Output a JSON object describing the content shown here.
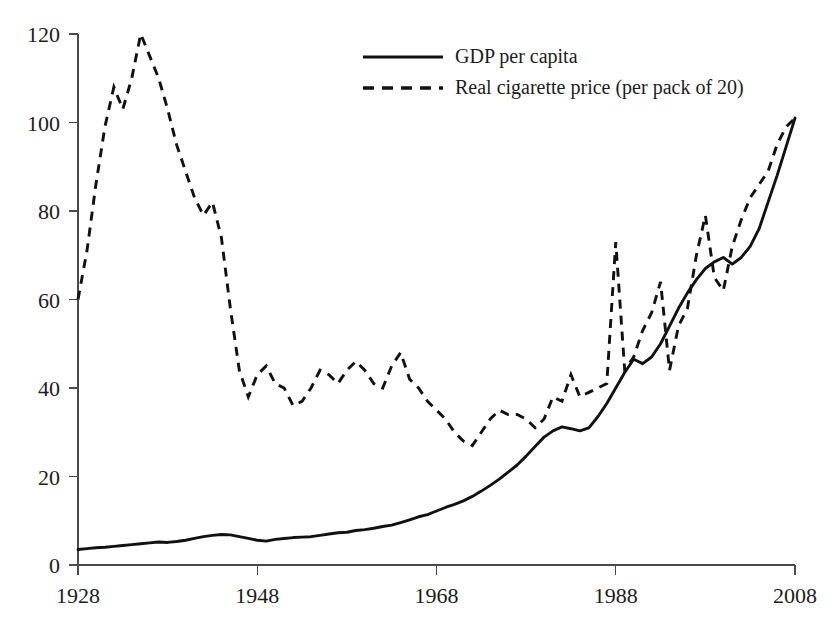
{
  "chart_data": {
    "type": "line",
    "title": "",
    "subtitle": "",
    "xlabel": "",
    "ylabel": "",
    "xlim": [
      1928,
      2008
    ],
    "ylim": [
      0,
      120
    ],
    "xticks": [
      1928,
      1948,
      1968,
      1988,
      2008
    ],
    "xtick_labels": [
      "1928",
      "1948",
      "1968",
      "1988",
      "2008"
    ],
    "yticks": [
      0,
      20,
      40,
      60,
      80,
      100,
      120
    ],
    "ytick_labels": [
      "0",
      "20",
      "40",
      "60",
      "80",
      "100",
      "120"
    ],
    "grid": false,
    "legend_position": "top-center-right",
    "x": [
      1928,
      1929,
      1930,
      1931,
      1932,
      1933,
      1934,
      1935,
      1936,
      1937,
      1938,
      1939,
      1940,
      1941,
      1942,
      1943,
      1944,
      1945,
      1946,
      1947,
      1948,
      1949,
      1950,
      1951,
      1952,
      1953,
      1954,
      1955,
      1956,
      1957,
      1958,
      1959,
      1960,
      1961,
      1962,
      1963,
      1964,
      1965,
      1966,
      1967,
      1968,
      1969,
      1970,
      1971,
      1972,
      1973,
      1974,
      1975,
      1976,
      1977,
      1978,
      1979,
      1980,
      1981,
      1982,
      1983,
      1984,
      1985,
      1986,
      1987,
      1988,
      1989,
      1990,
      1991,
      1992,
      1993,
      1994,
      1995,
      1996,
      1997,
      1998,
      1999,
      2000,
      2001,
      2002,
      2003,
      2004,
      2005,
      2006,
      2007,
      2008
    ],
    "series": [
      {
        "name": "GDP per capita",
        "style": "solid",
        "values": [
          3.5,
          3.7,
          3.9,
          4.0,
          4.2,
          4.4,
          4.6,
          4.8,
          5.0,
          5.2,
          5.1,
          5.3,
          5.6,
          6.0,
          6.4,
          6.7,
          6.9,
          6.8,
          6.4,
          6.0,
          5.6,
          5.4,
          5.8,
          6.0,
          6.2,
          6.3,
          6.4,
          6.7,
          7.0,
          7.3,
          7.4,
          7.8,
          8.0,
          8.3,
          8.7,
          9.0,
          9.6,
          10.2,
          10.9,
          11.4,
          12.2,
          13.0,
          13.7,
          14.5,
          15.5,
          16.7,
          18.0,
          19.4,
          21.0,
          22.6,
          24.6,
          26.8,
          28.9,
          30.3,
          31.2,
          30.8,
          30.3,
          31.0,
          33.5,
          36.5,
          40.0,
          43.5,
          46.5,
          45.5,
          47.0,
          50.0,
          54.0,
          58.0,
          61.5,
          64.5,
          67.0,
          68.5,
          69.5,
          68.0,
          69.5,
          72.0,
          76.0,
          82.0,
          88.0,
          94.5,
          101.0
        ]
      },
      {
        "name": "Real cigarette price (per pack of 20)",
        "style": "dashed",
        "values": [
          60,
          71,
          86,
          99,
          108,
          103,
          110,
          120,
          115,
          110,
          103,
          95,
          89,
          83,
          79,
          82,
          74,
          58,
          44,
          38,
          43,
          45,
          41,
          40,
          36,
          37,
          40,
          44,
          43,
          41,
          44,
          46,
          44,
          41,
          40,
          45,
          48,
          42,
          40,
          37,
          35,
          33,
          30,
          28,
          27,
          30,
          33,
          35,
          34,
          34,
          33,
          31,
          33,
          38,
          37,
          43,
          38,
          39,
          40,
          41,
          73,
          44,
          47,
          53,
          57,
          64,
          44,
          54,
          58,
          70,
          79,
          65,
          62,
          72,
          78,
          83,
          86,
          89,
          95,
          99,
          101
        ]
      }
    ]
  },
  "legend": {
    "items": [
      {
        "label": "GDP per capita",
        "style": "solid"
      },
      {
        "label": "Real cigarette price (per pack of 20)",
        "style": "dashed"
      }
    ]
  },
  "colors": {
    "background": "#ffffff",
    "line": "#111111",
    "axis": "#4a4a4a",
    "text": "#1c1c1c"
  }
}
